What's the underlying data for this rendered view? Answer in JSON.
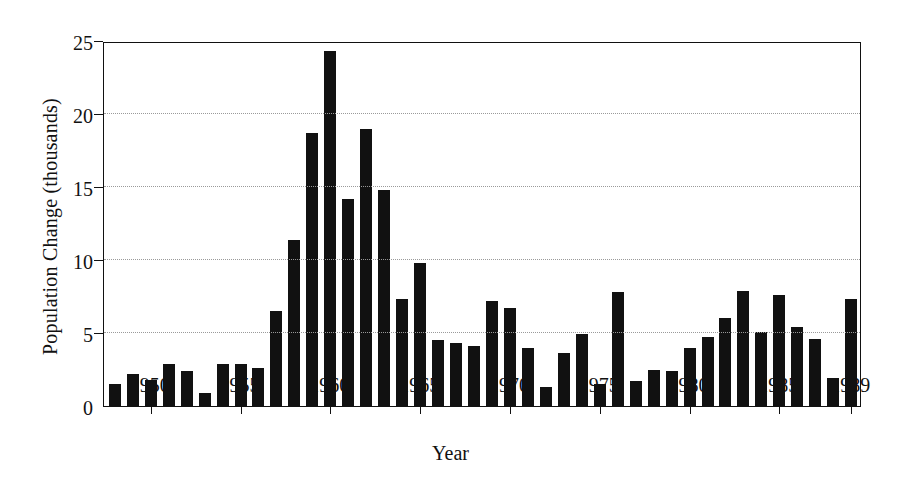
{
  "chart_data": {
    "type": "bar",
    "title": "",
    "xlabel": "Year",
    "ylabel": "Population Change (thousands)",
    "xlim": [
      1947.4,
      1989.6
    ],
    "ylim": [
      0,
      25
    ],
    "grid": true,
    "legend": null,
    "bar_color": "#111111",
    "background_color": "#ffffff",
    "ytick_labels": [
      "0",
      "5",
      "10",
      "15",
      "20",
      "25"
    ],
    "ytick_values": [
      0,
      5,
      10,
      15,
      20,
      25
    ],
    "xtick_labels": [
      "1950",
      "1955",
      "1960",
      "1965",
      "1970",
      "1975",
      "1980",
      "1985",
      "1989"
    ],
    "xtick_values": [
      1950,
      1955,
      1960,
      1965,
      1970,
      1975,
      1980,
      1985,
      1989
    ],
    "categories": [
      1948,
      1949,
      1950,
      1951,
      1952,
      1953,
      1954,
      1955,
      1956,
      1957,
      1958,
      1959,
      1960,
      1961,
      1962,
      1963,
      1964,
      1965,
      1966,
      1967,
      1968,
      1969,
      1970,
      1971,
      1972,
      1973,
      1974,
      1975,
      1976,
      1977,
      1978,
      1979,
      1980,
      1981,
      1982,
      1983,
      1984,
      1985,
      1986,
      1987,
      1988,
      1989
    ],
    "values": [
      1.5,
      2.2,
      1.8,
      2.9,
      2.4,
      0.9,
      2.9,
      2.9,
      2.6,
      6.5,
      11.4,
      18.7,
      24.3,
      14.2,
      19.0,
      14.8,
      7.3,
      9.8,
      4.5,
      4.3,
      4.1,
      7.2,
      6.7,
      4.0,
      1.3,
      3.6,
      4.9,
      1.5,
      7.8,
      1.7,
      2.5,
      2.4,
      4.0,
      4.7,
      6.0,
      7.9,
      5.1,
      7.6,
      5.4,
      4.6,
      1.9,
      7.3
    ]
  }
}
